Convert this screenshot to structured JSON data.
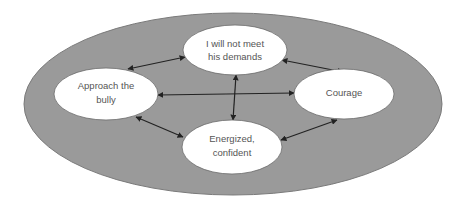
{
  "diagram": {
    "type": "concept-cycle",
    "outer": {
      "fill": "#999999",
      "stroke": "#7a7a7a"
    },
    "nodes": [
      {
        "id": "demands",
        "lines": [
          "I will not meet",
          "his demands"
        ]
      },
      {
        "id": "approach",
        "lines": [
          "Approach the",
          "bully"
        ]
      },
      {
        "id": "courage",
        "lines": [
          "Courage"
        ]
      },
      {
        "id": "energized",
        "lines": [
          "Energized,",
          "confident"
        ]
      }
    ],
    "edges": [
      {
        "from": "approach",
        "to": "demands",
        "bidirectional": true
      },
      {
        "from": "demands",
        "to": "courage",
        "bidirectional": true
      },
      {
        "from": "courage",
        "to": "energized",
        "bidirectional": true
      },
      {
        "from": "energized",
        "to": "approach",
        "bidirectional": true
      },
      {
        "from": "approach",
        "to": "courage",
        "bidirectional": true
      },
      {
        "from": "demands",
        "to": "energized",
        "bidirectional": true
      }
    ],
    "node_fill": "#ffffff",
    "edge_color": "#222222"
  }
}
